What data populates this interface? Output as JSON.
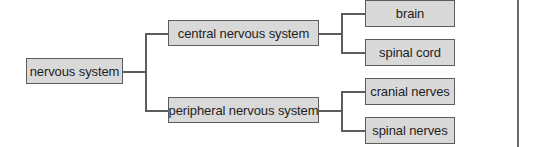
{
  "diagram": {
    "type": "tree",
    "orientation": "left-to-right",
    "colors": {
      "node_fill": "#d9d9d9",
      "node_border": "#5c5c5c",
      "connector": "#5c5c5c",
      "text": "#1e1e1e"
    },
    "root": {
      "label": "nervous system"
    },
    "level1": [
      {
        "label": "central nervous system",
        "children": [
          {
            "label": "brain"
          },
          {
            "label": "spinal cord"
          }
        ]
      },
      {
        "label": "peripheral nervous system",
        "children": [
          {
            "label": "cranial nerves"
          },
          {
            "label": "spinal nerves"
          }
        ]
      }
    ]
  }
}
